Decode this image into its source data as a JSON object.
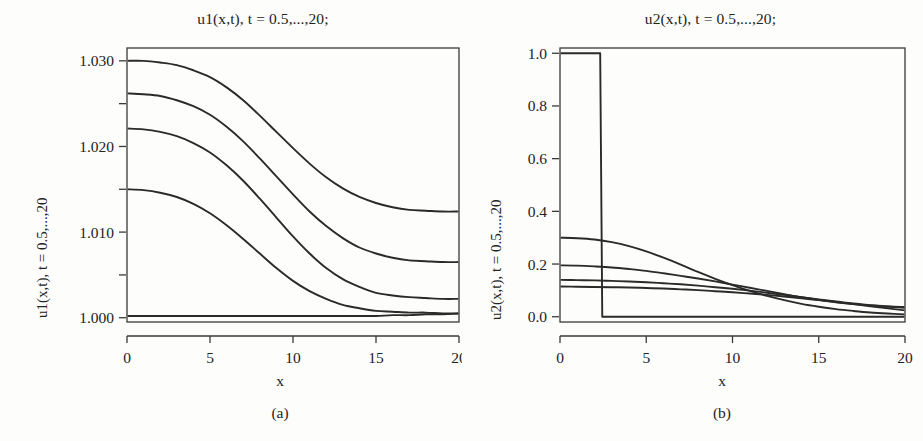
{
  "figure": {
    "background": "#fdfdfc",
    "line_color": "#2a2a2a",
    "axis_color": "#3a3a3a"
  },
  "panel_a": {
    "title": "u1(x,t), t = 0.5,...,20;",
    "ylabel": "u1(x,t), t = 0.5,...,20",
    "xlabel": "x",
    "caption": "(a)",
    "xticks": [
      "0",
      "5",
      "10",
      "15",
      "20"
    ],
    "yticks": [
      "1.000",
      "1.010",
      "1.020",
      "1.030"
    ]
  },
  "panel_b": {
    "title": "u2(x,t), t = 0.5,...,20;",
    "ylabel": "u2(x,t), t = 0.5,...,20",
    "xlabel": "x",
    "caption": "(b)",
    "xticks": [
      "0",
      "5",
      "10",
      "15",
      "20"
    ],
    "yticks": [
      "0.0",
      "0.2",
      "0.4",
      "0.6",
      "0.8",
      "1.0"
    ]
  },
  "chart_data": [
    {
      "type": "line",
      "panel": "(a)",
      "title": "u1(x,t), t = 0.5,...,20;",
      "xlabel": "x",
      "ylabel": "u1(x,t), t = 0.5,...,20",
      "xlim": [
        0,
        20
      ],
      "ylim": [
        0.9995,
        1.0315
      ],
      "xticks": [
        0,
        5,
        10,
        15,
        20
      ],
      "yticks": [
        1.0,
        1.01,
        1.02,
        1.03
      ],
      "minor_yticks": [
        1.005,
        1.015,
        1.025
      ],
      "grid": false,
      "legend": "none",
      "x": [
        0,
        1,
        2,
        3,
        4,
        5,
        6,
        7,
        8,
        9,
        10,
        11,
        12,
        13,
        14,
        15,
        16,
        17,
        18,
        19,
        20
      ],
      "series": [
        {
          "name": "t = 20",
          "values": [
            1.03,
            1.03,
            1.0298,
            1.0295,
            1.0289,
            1.0281,
            1.0269,
            1.0254,
            1.0236,
            1.0217,
            1.0198,
            1.018,
            1.0164,
            1.0151,
            1.0141,
            1.0134,
            1.0129,
            1.0126,
            1.0125,
            1.0124,
            1.0124
          ]
        },
        {
          "name": "t = 10",
          "values": [
            1.0262,
            1.0261,
            1.0259,
            1.0254,
            1.0247,
            1.0237,
            1.0223,
            1.0206,
            1.0186,
            1.0165,
            1.0144,
            1.0124,
            1.0107,
            1.0093,
            1.0082,
            1.0075,
            1.007,
            1.0067,
            1.0066,
            1.0065,
            1.0065
          ]
        },
        {
          "name": "t = 5",
          "values": [
            1.0221,
            1.022,
            1.0217,
            1.0212,
            1.0204,
            1.0193,
            1.0178,
            1.016,
            1.0139,
            1.0117,
            1.0095,
            1.0075,
            1.0058,
            1.0045,
            1.0036,
            1.0029,
            1.0026,
            1.0024,
            1.0023,
            1.0022,
            1.0022
          ]
        },
        {
          "name": "t = 2",
          "values": [
            1.015,
            1.0149,
            1.0146,
            1.0141,
            1.0133,
            1.0122,
            1.0108,
            1.0092,
            1.0075,
            1.0058,
            1.0043,
            1.0031,
            1.0022,
            1.0015,
            1.0011,
            1.0008,
            1.0007,
            1.0006,
            1.0006,
            1.0005,
            1.0005
          ]
        },
        {
          "name": "t = 0.5",
          "values": [
            1.0002,
            1.0002,
            1.0002,
            1.0002,
            1.0002,
            1.0002,
            1.0002,
            1.0002,
            1.0002,
            1.0002,
            1.0002,
            1.0002,
            1.0002,
            1.0002,
            1.0002,
            1.0002,
            1.0003,
            1.0003,
            1.0004,
            1.0004,
            1.0005
          ]
        }
      ]
    },
    {
      "type": "line",
      "panel": "(b)",
      "title": "u2(x,t), t = 0.5,...,20;",
      "xlabel": "x",
      "ylabel": "u2(x,t), t = 0.5,...,20",
      "xlim": [
        0,
        20
      ],
      "ylim": [
        -0.02,
        1.02
      ],
      "xticks": [
        0,
        5,
        10,
        15,
        20
      ],
      "yticks": [
        0.0,
        0.2,
        0.4,
        0.6,
        0.8,
        1.0
      ],
      "grid": false,
      "legend": "none",
      "x": [
        0,
        1,
        2,
        3,
        4,
        5,
        6,
        7,
        8,
        9,
        10,
        11,
        12,
        13,
        14,
        15,
        16,
        17,
        18,
        19,
        20
      ],
      "series": [
        {
          "name": "t = 0.5 (initial step)",
          "values": [
            1.0,
            1.0,
            1.0,
            0.0,
            0.0,
            0.0,
            0.0,
            0.0,
            0.0,
            0.0,
            0.0,
            0.0,
            0.0,
            0.0,
            0.0,
            0.0,
            0.0,
            0.0,
            0.0,
            0.0,
            0.0
          ],
          "note": "rectangular pulse: value 1.0 for x < 2.3, drops vertically to 0 at x = 2.4"
        },
        {
          "name": "t = 2",
          "values": [
            0.3,
            0.298,
            0.293,
            0.283,
            0.268,
            0.248,
            0.224,
            0.198,
            0.17,
            0.144,
            0.12,
            0.098,
            0.079,
            0.063,
            0.049,
            0.038,
            0.029,
            0.022,
            0.016,
            0.012,
            0.009
          ]
        },
        {
          "name": "t = 5",
          "values": [
            0.195,
            0.194,
            0.191,
            0.187,
            0.181,
            0.174,
            0.165,
            0.155,
            0.145,
            0.134,
            0.122,
            0.11,
            0.098,
            0.086,
            0.074,
            0.064,
            0.055,
            0.048,
            0.043,
            0.039,
            0.037
          ]
        },
        {
          "name": "t = 10",
          "values": [
            0.14,
            0.139,
            0.138,
            0.136,
            0.134,
            0.131,
            0.127,
            0.123,
            0.118,
            0.112,
            0.106,
            0.099,
            0.091,
            0.083,
            0.074,
            0.066,
            0.058,
            0.05,
            0.044,
            0.039,
            0.034
          ]
        },
        {
          "name": "t = 20",
          "values": [
            0.115,
            0.114,
            0.113,
            0.112,
            0.111,
            0.109,
            0.107,
            0.104,
            0.101,
            0.097,
            0.093,
            0.088,
            0.083,
            0.077,
            0.07,
            0.063,
            0.056,
            0.048,
            0.04,
            0.032,
            0.024
          ]
        }
      ]
    }
  ]
}
